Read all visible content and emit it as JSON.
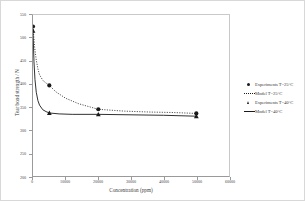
{
  "chart_data": {
    "type": "line",
    "title": "",
    "xlabel": "Concentration (ppm)",
    "ylabel": "Tear bond strength / N",
    "xlim": [
      0,
      60000
    ],
    "ylim": [
      200,
      550
    ],
    "xticks": [
      "0",
      "10000",
      "20000",
      "30000",
      "40000",
      "50000",
      "60000"
    ],
    "xtick_values": [
      0,
      10000,
      20000,
      30000,
      40000,
      50000,
      60000
    ],
    "yticks": [
      "550",
      "500",
      "450",
      "400",
      "350",
      "300",
      "250",
      "200"
    ],
    "ytick_values": [
      550,
      500,
      450,
      400,
      350,
      300,
      250,
      200
    ],
    "grid": false,
    "legend_position": "right",
    "series": [
      {
        "name": "Experiments T=25°C",
        "marker": "circle",
        "style": "points",
        "color": "#1a1a1a",
        "x": [
          0,
          5000,
          20000,
          50000
        ],
        "y": [
          525,
          397,
          345,
          336
        ]
      },
      {
        "name": "Model T=25°C",
        "marker": "none",
        "style": "dotted",
        "color": "#1a1a1a",
        "x": [
          0,
          500,
          1000,
          1500,
          2000,
          3000,
          4000,
          5000,
          7000,
          10000,
          14000,
          20000,
          28000,
          36000,
          43000,
          50000
        ],
        "y": [
          525,
          480,
          452,
          433,
          420,
          408,
          402,
          397,
          383,
          369,
          357,
          345,
          341,
          339,
          338,
          336
        ]
      },
      {
        "name": "Experiments T=40°C",
        "marker": "triangle",
        "style": "points",
        "color": "#1a1a1a",
        "x": [
          0,
          5000,
          20000,
          50000
        ],
        "y": [
          516,
          337,
          334,
          330
        ]
      },
      {
        "name": "Model T=40°C",
        "marker": "none",
        "style": "solid",
        "color": "#1a1a1a",
        "x": [
          0,
          300,
          600,
          1000,
          1500,
          2000,
          3000,
          4000,
          5000,
          8000,
          12000,
          20000,
          30000,
          40000,
          50000
        ],
        "y": [
          516,
          448,
          410,
          382,
          364,
          354,
          344,
          340,
          337,
          335,
          334,
          334,
          333,
          332,
          330
        ]
      }
    ]
  },
  "legend": {
    "items": [
      {
        "label": "Experiments T=25°C",
        "key": "circle-marker"
      },
      {
        "label": "Model T=25°C",
        "key": "dotted-line"
      },
      {
        "label": "Experiments T=40°C",
        "key": "triangle-marker"
      },
      {
        "label": "Model T=40°C",
        "key": "solid-line"
      }
    ]
  },
  "colors": {
    "series": "#1a1a1a",
    "axis": "#9a9a9a",
    "frame": "#d8d8d8",
    "text": "#3a3a3a"
  }
}
